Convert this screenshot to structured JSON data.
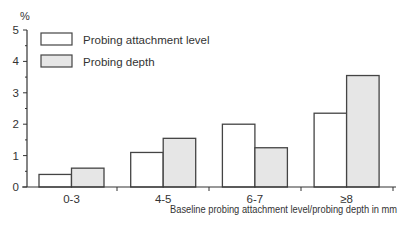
{
  "chart_data": {
    "type": "bar",
    "title": "",
    "ylabel": "%",
    "xlabel": "Baseline probing attachment level/probing depth in mm",
    "ylim": [
      0,
      5
    ],
    "yticks": [
      0,
      1,
      2,
      3,
      4,
      5
    ],
    "grid": false,
    "legend_position": "upper-left",
    "categories": [
      "0-3",
      "4-5",
      "6-7",
      "≥8"
    ],
    "series": [
      {
        "name": "Probing attachment level",
        "color": "#ffffff",
        "values": [
          0.4,
          1.1,
          2.0,
          2.35
        ]
      },
      {
        "name": "Probing depth",
        "color": "#e6e6e6",
        "values": [
          0.6,
          1.55,
          1.25,
          3.55
        ]
      }
    ]
  },
  "colors": {
    "axis": "#333333",
    "bar_border": "#444444",
    "bar_fill_1": "#ffffff",
    "bar_fill_2": "#e6e6e6"
  }
}
